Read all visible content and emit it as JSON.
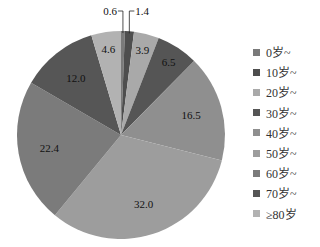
{
  "chart_data": {
    "type": "pie",
    "title": "",
    "start": "12 o'clock",
    "direction": "clockwise",
    "legend_position": "right",
    "slices": [
      {
        "label": "0岁~",
        "value": 0.6,
        "value_label": "0.6",
        "color": "#7a7a7a"
      },
      {
        "label": "10岁~",
        "value": 1.4,
        "value_label": "1.4",
        "color": "#4e4e4e"
      },
      {
        "label": "20岁~",
        "value": 3.9,
        "value_label": "3.9",
        "color": "#a9a9a9"
      },
      {
        "label": "30岁~",
        "value": 6.5,
        "value_label": "6.5",
        "color": "#555555"
      },
      {
        "label": "40岁~",
        "value": 16.5,
        "value_label": "16.5",
        "color": "#8f8f8f"
      },
      {
        "label": "50岁~",
        "value": 32.0,
        "value_label": "32.0",
        "color": "#9d9d9d"
      },
      {
        "label": "60岁~",
        "value": 22.4,
        "value_label": "22.4",
        "color": "#7b7b7b"
      },
      {
        "label": "70岁~",
        "value": 12.0,
        "value_label": "12.0",
        "color": "#565656"
      },
      {
        "label": "≥80岁",
        "value": 4.6,
        "value_label": "4.6",
        "color": "#b2b2b2"
      }
    ],
    "leader_line_labels": [
      "0.6",
      "1.4"
    ]
  }
}
